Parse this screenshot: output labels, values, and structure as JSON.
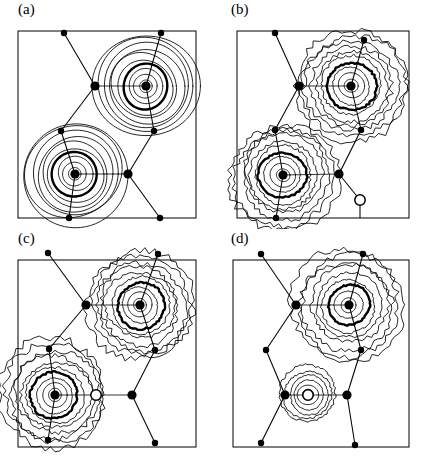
{
  "figure": {
    "type": "contour-map-grid",
    "rows": 2,
    "columns": 2,
    "background_color": "#ffffff",
    "line_color": "#000000"
  },
  "panels": [
    {
      "id": "a",
      "label": "(a)",
      "contour_style": "smooth",
      "frame": {
        "x": 18,
        "y": 31,
        "width": 178,
        "height": 187
      },
      "peaks": [
        {
          "name": "upper-right-peak",
          "cx": 146,
          "cy": 86,
          "rings": 10,
          "bold_ring_index": 4,
          "max_radius": 52,
          "shape": "round"
        },
        {
          "name": "lower-left-peak",
          "cx": 75,
          "cy": 174,
          "rings": 10,
          "bold_ring_index": 4,
          "max_radius": 52,
          "shape": "round"
        }
      ],
      "atoms": [
        {
          "name": "atom-top-left",
          "cx": 64,
          "cy": 33,
          "r": 3.2,
          "type": "filled"
        },
        {
          "name": "atom-upper-mid",
          "cx": 95,
          "cy": 86,
          "r": 4.6,
          "type": "filled"
        },
        {
          "name": "atom-upper-center",
          "cx": 146,
          "cy": 86,
          "r": 4.6,
          "type": "filled"
        },
        {
          "name": "atom-top-right",
          "cx": 161,
          "cy": 33,
          "r": 3.2,
          "type": "filled"
        },
        {
          "name": "atom-mid-right",
          "cx": 154,
          "cy": 131,
          "r": 3.2,
          "type": "filled"
        },
        {
          "name": "atom-mid-left",
          "cx": 61,
          "cy": 131,
          "r": 3.2,
          "type": "filled"
        },
        {
          "name": "atom-lower-center",
          "cx": 75,
          "cy": 174,
          "r": 4.6,
          "type": "filled"
        },
        {
          "name": "atom-lower-right",
          "cx": 128,
          "cy": 174,
          "r": 4.6,
          "type": "filled"
        },
        {
          "name": "atom-bottom-left",
          "cx": 69,
          "cy": 218,
          "r": 3.2,
          "type": "filled"
        },
        {
          "name": "atom-bottom-right",
          "cx": 160,
          "cy": 218,
          "r": 3.2,
          "type": "filled"
        }
      ],
      "bonds": [
        {
          "name": "bond-topleft-uppermid",
          "x1": 64,
          "y1": 33,
          "x2": 95,
          "y2": 86
        },
        {
          "name": "bond-uppermid-uppercenter",
          "x1": 95,
          "y1": 86,
          "x2": 146,
          "y2": 86
        },
        {
          "name": "bond-uppercenter-topright",
          "x1": 146,
          "y1": 86,
          "x2": 161,
          "y2": 33
        },
        {
          "name": "bond-uppercenter-midright",
          "x1": 146,
          "y1": 86,
          "x2": 154,
          "y2": 131
        },
        {
          "name": "bond-uppermid-midleft",
          "x1": 95,
          "y1": 86,
          "x2": 61,
          "y2": 131
        },
        {
          "name": "bond-midleft-lowercenter",
          "x1": 61,
          "y1": 131,
          "x2": 75,
          "y2": 174
        },
        {
          "name": "bond-lowercenter-lowerright",
          "x1": 75,
          "y1": 174,
          "x2": 128,
          "y2": 174
        },
        {
          "name": "bond-midright-lowerright",
          "x1": 154,
          "y1": 131,
          "x2": 128,
          "y2": 174
        },
        {
          "name": "bond-lowercenter-bottomleft",
          "x1": 75,
          "y1": 174,
          "x2": 69,
          "y2": 218
        },
        {
          "name": "bond-lowerright-bottomright",
          "x1": 128,
          "y1": 174,
          "x2": 160,
          "y2": 218
        }
      ]
    },
    {
      "id": "b",
      "label": "(b)",
      "contour_style": "jagged",
      "frame": {
        "x": 24,
        "y": 31,
        "width": 172,
        "height": 187
      },
      "peaks": [
        {
          "name": "upper-right-peak",
          "cx": 138,
          "cy": 86,
          "rings": 10,
          "bold_ring_index": 4,
          "max_radius": 56,
          "shape": "jagged"
        },
        {
          "name": "lower-left-peak",
          "cx": 70,
          "cy": 175,
          "rings": 10,
          "bold_ring_index": 4,
          "max_radius": 54,
          "shape": "jagged"
        }
      ],
      "atoms": [
        {
          "name": "atom-top-left",
          "cx": 62,
          "cy": 33,
          "r": 3.2,
          "type": "filled"
        },
        {
          "name": "atom-upper-mid",
          "cx": 86,
          "cy": 86,
          "r": 4.6,
          "type": "filled"
        },
        {
          "name": "atom-upper-center",
          "cx": 138,
          "cy": 86,
          "r": 4.6,
          "type": "filled"
        },
        {
          "name": "atom-top-right",
          "cx": 151,
          "cy": 40,
          "r": 3.2,
          "type": "filled"
        },
        {
          "name": "atom-mid-right",
          "cx": 148,
          "cy": 130,
          "r": 3.2,
          "type": "filled"
        },
        {
          "name": "atom-mid-left",
          "cx": 62,
          "cy": 130,
          "r": 3.2,
          "type": "filled"
        },
        {
          "name": "atom-lower-center",
          "cx": 70,
          "cy": 175,
          "r": 4.6,
          "type": "filled"
        },
        {
          "name": "atom-lower-right",
          "cx": 126,
          "cy": 174,
          "r": 4.6,
          "type": "filled"
        },
        {
          "name": "atom-bottom-left",
          "cx": 63,
          "cy": 218,
          "r": 3.2,
          "type": "filled"
        },
        {
          "name": "atom-open-lower-right",
          "cx": 147,
          "cy": 200,
          "r": 5.2,
          "type": "open"
        }
      ],
      "bonds": [
        {
          "name": "bond-topleft-uppermid",
          "x1": 62,
          "y1": 33,
          "x2": 86,
          "y2": 86
        },
        {
          "name": "bond-uppermid-uppercenter",
          "x1": 86,
          "y1": 86,
          "x2": 138,
          "y2": 86
        },
        {
          "name": "bond-uppercenter-topright",
          "x1": 138,
          "y1": 86,
          "x2": 151,
          "y2": 40
        },
        {
          "name": "bond-uppercenter-midright",
          "x1": 138,
          "y1": 86,
          "x2": 148,
          "y2": 130
        },
        {
          "name": "bond-uppermid-midleft",
          "x1": 86,
          "y1": 86,
          "x2": 62,
          "y2": 130
        },
        {
          "name": "bond-midleft-lowercenter",
          "x1": 62,
          "y1": 130,
          "x2": 70,
          "y2": 175
        },
        {
          "name": "bond-lowercenter-lowerright",
          "x1": 70,
          "y1": 175,
          "x2": 126,
          "y2": 174
        },
        {
          "name": "bond-midright-lowerright",
          "x1": 148,
          "y1": 130,
          "x2": 126,
          "y2": 174
        },
        {
          "name": "bond-lowercenter-bottomleft",
          "x1": 70,
          "y1": 175,
          "x2": 63,
          "y2": 218
        },
        {
          "name": "bond-lowerright-openatom",
          "x1": 126,
          "y1": 174,
          "x2": 147,
          "y2": 200
        },
        {
          "name": "bond-openatom-bottom",
          "x1": 147,
          "y1": 200,
          "x2": 147,
          "y2": 218
        }
      ]
    },
    {
      "id": "c",
      "label": "(c)",
      "contour_style": "jagged",
      "frame": {
        "x": 18,
        "y": 31,
        "width": 178,
        "height": 187
      },
      "peaks": [
        {
          "name": "upper-right-peak",
          "cx": 140,
          "cy": 76,
          "rings": 10,
          "bold_ring_index": 4,
          "max_radius": 54,
          "shape": "jagged"
        },
        {
          "name": "lower-left-peak",
          "cx": 55,
          "cy": 166,
          "rings": 10,
          "bold_ring_index": 4,
          "max_radius": 54,
          "shape": "jagged"
        }
      ],
      "atoms": [
        {
          "name": "atom-top-left",
          "cx": 48,
          "cy": 24,
          "r": 3.2,
          "type": "filled"
        },
        {
          "name": "atom-upper-mid",
          "cx": 86,
          "cy": 76,
          "r": 4.6,
          "type": "filled"
        },
        {
          "name": "atom-upper-center",
          "cx": 140,
          "cy": 76,
          "r": 4.6,
          "type": "filled"
        },
        {
          "name": "atom-top-right",
          "cx": 158,
          "cy": 25,
          "r": 3.2,
          "type": "filled"
        },
        {
          "name": "atom-mid-right",
          "cx": 155,
          "cy": 121,
          "r": 3.2,
          "type": "filled"
        },
        {
          "name": "atom-mid-left",
          "cx": 49,
          "cy": 120,
          "r": 3.2,
          "type": "filled"
        },
        {
          "name": "atom-lower-center",
          "cx": 55,
          "cy": 166,
          "r": 4.6,
          "type": "filled"
        },
        {
          "name": "atom-open-middle",
          "cx": 96,
          "cy": 166,
          "r": 5.2,
          "type": "open"
        },
        {
          "name": "atom-lower-right",
          "cx": 132,
          "cy": 166,
          "r": 4.6,
          "type": "filled"
        },
        {
          "name": "atom-bottom-left",
          "cx": 48,
          "cy": 211,
          "r": 3.2,
          "type": "filled"
        },
        {
          "name": "atom-bottom-right",
          "cx": 155,
          "cy": 214,
          "r": 3.2,
          "type": "filled"
        }
      ],
      "bonds": [
        {
          "name": "bond-topleft-uppermid",
          "x1": 48,
          "y1": 24,
          "x2": 86,
          "y2": 76
        },
        {
          "name": "bond-uppermid-uppercenter",
          "x1": 86,
          "y1": 76,
          "x2": 140,
          "y2": 76
        },
        {
          "name": "bond-uppercenter-topright",
          "x1": 140,
          "y1": 76,
          "x2": 158,
          "y2": 25
        },
        {
          "name": "bond-uppercenter-midright",
          "x1": 140,
          "y1": 76,
          "x2": 155,
          "y2": 121
        },
        {
          "name": "bond-uppermid-midleft",
          "x1": 86,
          "y1": 76,
          "x2": 49,
          "y2": 120
        },
        {
          "name": "bond-midleft-lowercenter",
          "x1": 49,
          "y1": 120,
          "x2": 55,
          "y2": 166
        },
        {
          "name": "bond-lowercenter-openatom",
          "x1": 55,
          "y1": 166,
          "x2": 96,
          "y2": 166
        },
        {
          "name": "bond-openatom-lowerright",
          "x1": 96,
          "y1": 166,
          "x2": 132,
          "y2": 166
        },
        {
          "name": "bond-midright-lowerright",
          "x1": 155,
          "y1": 121,
          "x2": 132,
          "y2": 166
        },
        {
          "name": "bond-lowercenter-bottomleft",
          "x1": 55,
          "y1": 166,
          "x2": 48,
          "y2": 211
        },
        {
          "name": "bond-lowerright-bottomright",
          "x1": 132,
          "y1": 166,
          "x2": 155,
          "y2": 214
        }
      ]
    },
    {
      "id": "d",
      "label": "(d)",
      "contour_style": "jagged",
      "frame": {
        "x": 20,
        "y": 31,
        "width": 176,
        "height": 187
      },
      "peaks": [
        {
          "name": "upper-right-peak",
          "cx": 136,
          "cy": 76,
          "rings": 9,
          "bold_ring_index": 3,
          "max_radius": 56,
          "shape": "jagged"
        },
        {
          "name": "lower-small-peak",
          "cx": 95,
          "cy": 166,
          "rings": 6,
          "bold_ring_index": -1,
          "max_radius": 28,
          "shape": "jagged"
        }
      ],
      "atoms": [
        {
          "name": "atom-top-left",
          "cx": 48,
          "cy": 25,
          "r": 3.2,
          "type": "filled"
        },
        {
          "name": "atom-upper-mid",
          "cx": 83,
          "cy": 76,
          "r": 4.6,
          "type": "filled"
        },
        {
          "name": "atom-upper-center",
          "cx": 136,
          "cy": 76,
          "r": 4.6,
          "type": "filled"
        },
        {
          "name": "atom-top-right",
          "cx": 150,
          "cy": 25,
          "r": 3.2,
          "type": "filled"
        },
        {
          "name": "atom-mid-right",
          "cx": 148,
          "cy": 121,
          "r": 3.2,
          "type": "filled"
        },
        {
          "name": "atom-mid-left",
          "cx": 53,
          "cy": 121,
          "r": 3.2,
          "type": "filled"
        },
        {
          "name": "atom-lower-left",
          "cx": 72,
          "cy": 166,
          "r": 4.6,
          "type": "filled"
        },
        {
          "name": "atom-open-center",
          "cx": 95,
          "cy": 166,
          "r": 5.2,
          "type": "open"
        },
        {
          "name": "atom-lower-right",
          "cx": 134,
          "cy": 166,
          "r": 4.6,
          "type": "filled"
        },
        {
          "name": "atom-bottom-left",
          "cx": 48,
          "cy": 214,
          "r": 3.2,
          "type": "filled"
        },
        {
          "name": "atom-bottom-right",
          "cx": 142,
          "cy": 216,
          "r": 3.2,
          "type": "filled"
        }
      ],
      "bonds": [
        {
          "name": "bond-topleft-uppermid",
          "x1": 48,
          "y1": 25,
          "x2": 83,
          "y2": 76
        },
        {
          "name": "bond-uppermid-uppercenter",
          "x1": 83,
          "y1": 76,
          "x2": 136,
          "y2": 76
        },
        {
          "name": "bond-uppercenter-topright",
          "x1": 136,
          "y1": 76,
          "x2": 150,
          "y2": 25
        },
        {
          "name": "bond-uppercenter-midright",
          "x1": 136,
          "y1": 76,
          "x2": 148,
          "y2": 121
        },
        {
          "name": "bond-uppermid-midleft",
          "x1": 83,
          "y1": 76,
          "x2": 53,
          "y2": 121
        },
        {
          "name": "bond-midleft-lowerleft",
          "x1": 53,
          "y1": 121,
          "x2": 72,
          "y2": 166
        },
        {
          "name": "bond-lowerleft-openatom",
          "x1": 72,
          "y1": 166,
          "x2": 95,
          "y2": 166
        },
        {
          "name": "bond-openatom-lowerright",
          "x1": 95,
          "y1": 166,
          "x2": 134,
          "y2": 166
        },
        {
          "name": "bond-midright-lowerright",
          "x1": 148,
          "y1": 121,
          "x2": 134,
          "y2": 166
        },
        {
          "name": "bond-lowerleft-bottomleft",
          "x1": 72,
          "y1": 166,
          "x2": 48,
          "y2": 214
        },
        {
          "name": "bond-lowerright-bottomright",
          "x1": 134,
          "y1": 166,
          "x2": 142,
          "y2": 216
        }
      ]
    }
  ]
}
